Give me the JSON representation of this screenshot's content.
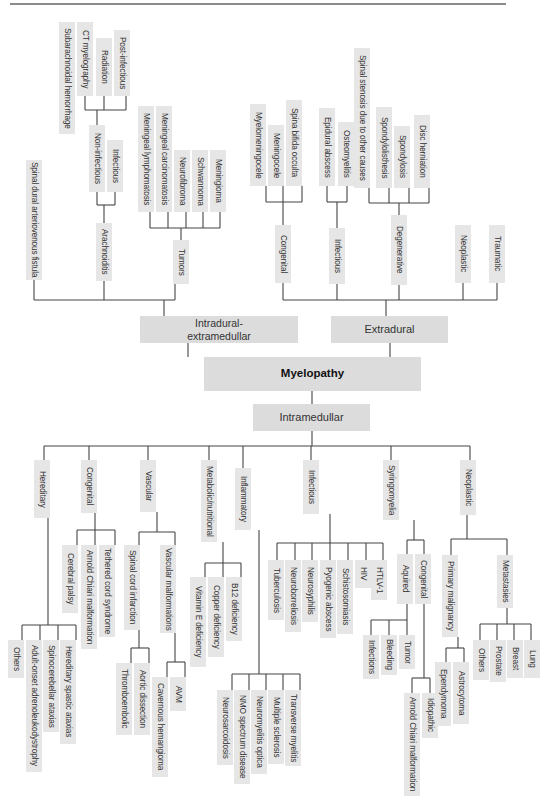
{
  "title": "Myelopathy",
  "colors": {
    "box": "#e6e6e6",
    "main_box": "#dcdcdc",
    "line": "#444444",
    "rule": "#8c8c8c"
  },
  "main_nodes": {
    "root": "Myelopathy",
    "intradural": "Intradural-\nextramedullar",
    "extradural": "Extradural",
    "intramedullar": "Intramedullar"
  },
  "nodes": [
    {
      "id": "sdavf",
      "label": "Spinal dural arteriovenous fistula",
      "x": 34,
      "y": 160,
      "h": 120
    },
    {
      "id": "arach",
      "label": "Arachnoiditis",
      "x": 104,
      "y": 223,
      "h": 58
    },
    {
      "id": "infect_a",
      "label": "Infectious",
      "x": 115,
      "y": 140,
      "h": 52
    },
    {
      "id": "noninf",
      "label": "Non-infectious",
      "x": 97,
      "y": 125,
      "h": 67
    },
    {
      "id": "subarach",
      "label": "Subarachnoidal hemorrhage",
      "x": 67,
      "y": 22,
      "h": 112
    },
    {
      "id": "ctmye",
      "label": "CT myelography",
      "x": 85,
      "y": 22,
      "h": 74
    },
    {
      "id": "radiation",
      "label": "Radiation",
      "x": 104,
      "y": 38,
      "h": 58
    },
    {
      "id": "postinf",
      "label": "Post-infectious",
      "x": 122,
      "y": 30,
      "h": 66
    },
    {
      "id": "tumors",
      "label": "Tumors",
      "x": 181,
      "y": 240,
      "h": 44
    },
    {
      "id": "mlymph",
      "label": "Meningeal lymphomatosis",
      "x": 146,
      "y": 106,
      "h": 106
    },
    {
      "id": "mcarc",
      "label": "Meningeal carcinomatosis",
      "x": 164,
      "y": 106,
      "h": 106
    },
    {
      "id": "neurofib",
      "label": "Neurofibroma",
      "x": 182,
      "y": 150,
      "h": 62
    },
    {
      "id": "schwann",
      "label": "Schwannoma",
      "x": 200,
      "y": 150,
      "h": 62
    },
    {
      "id": "mening",
      "label": "Meningioma",
      "x": 218,
      "y": 150,
      "h": 62
    },
    {
      "id": "congenital_e",
      "label": "Congenital",
      "x": 283,
      "y": 225,
      "h": 58
    },
    {
      "id": "myelomen",
      "label": "Myelomeningocele",
      "x": 258,
      "y": 104,
      "h": 82
    },
    {
      "id": "meningocele",
      "label": "Meningocele",
      "x": 276,
      "y": 125,
      "h": 61
    },
    {
      "id": "sbo",
      "label": "Spina bifida occulta",
      "x": 294,
      "y": 100,
      "h": 86
    },
    {
      "id": "infectious_e",
      "label": "Infectious",
      "x": 337,
      "y": 228,
      "h": 56
    },
    {
      "id": "epidural",
      "label": "Epidural abscess",
      "x": 327,
      "y": 108,
      "h": 78
    },
    {
      "id": "osteo",
      "label": "Osteomyelitis",
      "x": 346,
      "y": 122,
      "h": 64
    },
    {
      "id": "degen",
      "label": "Degenerative",
      "x": 399,
      "y": 215,
      "h": 70
    },
    {
      "id": "stenosis",
      "label": "Spinal stenosis due to other causes",
      "x": 362,
      "y": 48,
      "h": 140
    },
    {
      "id": "spondylolis",
      "label": "Spondylolisthesis",
      "x": 384,
      "y": 107,
      "h": 81
    },
    {
      "id": "spondylosis",
      "label": "Spondylosis",
      "x": 402,
      "y": 126,
      "h": 62
    },
    {
      "id": "disc",
      "label": "Disc herniation",
      "x": 422,
      "y": 115,
      "h": 73
    },
    {
      "id": "neoplastic_e",
      "label": "Neoplastic",
      "x": 463,
      "y": 225,
      "h": 58
    },
    {
      "id": "traumatic",
      "label": "Traumatic",
      "x": 497,
      "y": 225,
      "h": 58
    },
    {
      "id": "hereditary",
      "label": "Hereditary",
      "x": 42,
      "y": 460,
      "h": 58
    },
    {
      "id": "hosp",
      "label": "Others",
      "x": 16,
      "y": 640,
      "h": 38
    },
    {
      "id": "aald",
      "label": "Adult-onset adrenoleukodystrophy",
      "x": 34,
      "y": 640,
      "h": 132
    },
    {
      "id": "sca",
      "label": "Spinocerebellar ataxias",
      "x": 51,
      "y": 640,
      "h": 92
    },
    {
      "id": "hsp",
      "label": "Hereditary spastic ataxias",
      "x": 68,
      "y": 640,
      "h": 104
    },
    {
      "id": "congenital_i",
      "label": "Congenital",
      "x": 89,
      "y": 460,
      "h": 53
    },
    {
      "id": "cpalsy",
      "label": "Cerebral palsy",
      "x": 70,
      "y": 545,
      "h": 68
    },
    {
      "id": "acm1",
      "label": "Arnold Chiari malformation",
      "x": 89,
      "y": 545,
      "h": 104
    },
    {
      "id": "tethered",
      "label": "Tethered cord syndrome",
      "x": 107,
      "y": 545,
      "h": 92
    },
    {
      "id": "vascular",
      "label": "Vascular",
      "x": 148,
      "y": 460,
      "h": 52
    },
    {
      "id": "sci",
      "label": "Spinal cord infarction",
      "x": 132,
      "y": 545,
      "h": 85
    },
    {
      "id": "vmal",
      "label": "Vascular malformations",
      "x": 168,
      "y": 545,
      "h": 88
    },
    {
      "id": "thrombo",
      "label": "Thromboembolic",
      "x": 124,
      "y": 663,
      "h": 72
    },
    {
      "id": "aortic",
      "label": "Aortic dissection",
      "x": 142,
      "y": 663,
      "h": 72
    },
    {
      "id": "cavern",
      "label": "Cavernous hemangioma",
      "x": 160,
      "y": 677,
      "h": 100
    },
    {
      "id": "avm",
      "label": "AVM",
      "x": 178,
      "y": 677,
      "h": 34
    },
    {
      "id": "metab",
      "label": "Metabolic/nutritional",
      "x": 209,
      "y": 460,
      "h": 82
    },
    {
      "id": "vite",
      "label": "Vitamin E deficiency",
      "x": 198,
      "y": 577,
      "h": 90
    },
    {
      "id": "copper",
      "label": "Copper deficiency",
      "x": 216,
      "y": 577,
      "h": 80
    },
    {
      "id": "b12",
      "label": "B12 deficiency",
      "x": 234,
      "y": 577,
      "h": 64
    },
    {
      "id": "inflam",
      "label": "Inflammatory",
      "x": 243,
      "y": 468,
      "h": 62
    },
    {
      "id": "neurosarc",
      "label": "Neurosarcoidosis",
      "x": 225,
      "y": 690,
      "h": 75
    },
    {
      "id": "nmosd",
      "label": "NMO spectrum disease",
      "x": 242,
      "y": 690,
      "h": 94
    },
    {
      "id": "nmo",
      "label": "Neuromyelitis optica",
      "x": 259,
      "y": 690,
      "h": 84
    },
    {
      "id": "ms",
      "label": "Multiple sclerosis",
      "x": 276,
      "y": 690,
      "h": 74
    },
    {
      "id": "tm",
      "label": "Transverse myelitis",
      "x": 293,
      "y": 690,
      "h": 76
    },
    {
      "id": "infect_i",
      "label": "Infectious",
      "x": 311,
      "y": 460,
      "h": 54
    },
    {
      "id": "tb",
      "label": "Tuberculosis",
      "x": 276,
      "y": 560,
      "h": 60
    },
    {
      "id": "neurobor",
      "label": "Neuroborreliosis",
      "x": 293,
      "y": 560,
      "h": 72
    },
    {
      "id": "neurosyph",
      "label": "Neurosyphilis",
      "x": 310,
      "y": 560,
      "h": 62
    },
    {
      "id": "pyogenic",
      "label": "Pyogenic abscess",
      "x": 328,
      "y": 560,
      "h": 78
    },
    {
      "id": "schisto",
      "label": "Schistosomiasis",
      "x": 345,
      "y": 560,
      "h": 74
    },
    {
      "id": "hiv",
      "label": "HIV",
      "x": 363,
      "y": 560,
      "h": 28
    },
    {
      "id": "htlv",
      "label": "HTLV-1",
      "x": 379,
      "y": 560,
      "h": 40
    },
    {
      "id": "syringo",
      "label": "Syringomyelia",
      "x": 391,
      "y": 460,
      "h": 60
    },
    {
      "id": "aquired",
      "label": "Aquired",
      "x": 405,
      "y": 554,
      "h": 50
    },
    {
      "id": "congenital_s",
      "label": "Congenital",
      "x": 423,
      "y": 554,
      "h": 50
    },
    {
      "id": "infections_s",
      "label": "Infections",
      "x": 371,
      "y": 635,
      "h": 44
    },
    {
      "id": "bleeding",
      "label": "Bleeding",
      "x": 389,
      "y": 635,
      "h": 40
    },
    {
      "id": "tumor_s",
      "label": "Tumor",
      "x": 407,
      "y": 635,
      "h": 34
    },
    {
      "id": "acm2",
      "label": "Arnold Chiari malformation",
      "x": 412,
      "y": 693,
      "h": 103
    },
    {
      "id": "idiopathic",
      "label": "Idiopathic",
      "x": 430,
      "y": 693,
      "h": 45
    },
    {
      "id": "neoplastic_i",
      "label": "Neoplastic",
      "x": 468,
      "y": 460,
      "h": 55
    },
    {
      "id": "primary",
      "label": "Primary malignancy",
      "x": 450,
      "y": 555,
      "h": 82
    },
    {
      "id": "metast",
      "label": "Metastasies",
      "x": 505,
      "y": 555,
      "h": 53
    },
    {
      "id": "ependym",
      "label": "Ependymoma",
      "x": 443,
      "y": 662,
      "h": 64
    },
    {
      "id": "astro",
      "label": "Astrocytoma",
      "x": 461,
      "y": 662,
      "h": 62
    },
    {
      "id": "others_m",
      "label": "Others",
      "x": 481,
      "y": 640,
      "h": 40
    },
    {
      "id": "prostate",
      "label": "Prostate",
      "x": 498,
      "y": 640,
      "h": 42
    },
    {
      "id": "breast",
      "label": "Breast",
      "x": 515,
      "y": 640,
      "h": 38
    },
    {
      "id": "lung",
      "label": "Lung",
      "x": 532,
      "y": 640,
      "h": 38
    }
  ]
}
